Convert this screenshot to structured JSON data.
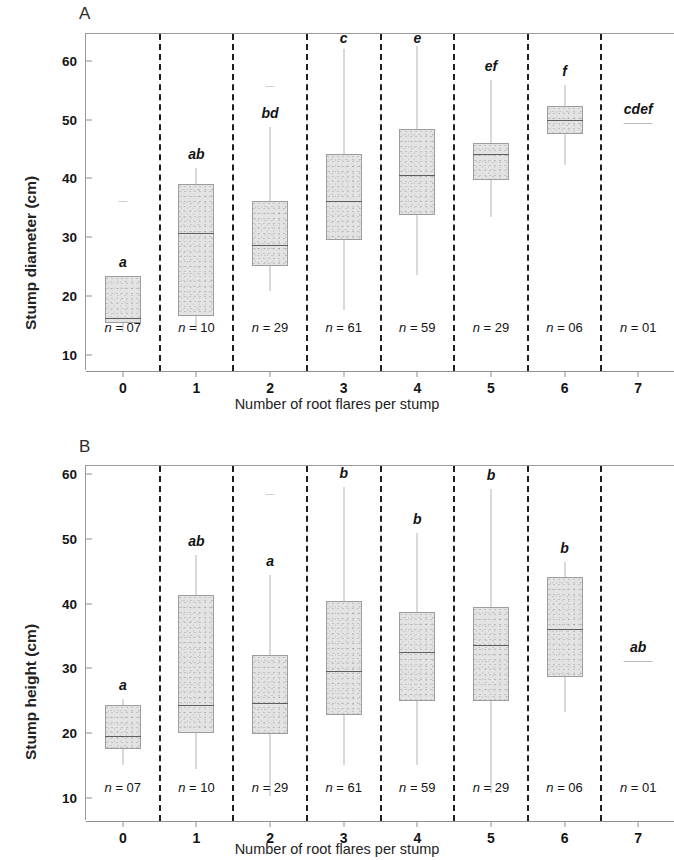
{
  "figure": {
    "panels": [
      {
        "letter": "A",
        "ylabel": "Stump diameter (cm)",
        "xlabel": "Number of root flares per stump"
      },
      {
        "letter": "B",
        "ylabel": "Stump height (cm)",
        "xlabel": "Number of root flares per stump"
      }
    ]
  },
  "chart_data": [
    {
      "type": "box",
      "panel": "A",
      "title": "A",
      "xlabel": "Number of root flares per stump",
      "ylabel": "Stump diameter (cm)",
      "ylim": [
        7,
        64
      ],
      "yticks": [
        10,
        20,
        30,
        40,
        50,
        60
      ],
      "xticks": [
        "0",
        "1",
        "2",
        "3",
        "4",
        "5",
        "6",
        "7"
      ],
      "grid": false,
      "legend": "none",
      "group_separators": "dashed vertical lines between every category",
      "boxes": [
        {
          "category": "0",
          "n_label": "n = 07",
          "n": 7,
          "group_letter": "a",
          "whisker_low": 13.8,
          "q1": 15.3,
          "median": 16.3,
          "q3": 23.4,
          "whisker_high": 23.4,
          "outliers": [
            36.1
          ]
        },
        {
          "category": "1",
          "n_label": "n = 10",
          "n": 10,
          "group_letter": "ab",
          "whisker_low": 14.0,
          "q1": 16.6,
          "median": 30.7,
          "q3": 39.0,
          "whisker_high": 41.8,
          "outliers": []
        },
        {
          "category": "2",
          "n_label": "n = 29",
          "n": 29,
          "group_letter": "bd",
          "whisker_low": 20.8,
          "q1": 25.0,
          "median": 28.6,
          "q3": 36.1,
          "whisker_high": 48.7,
          "outliers": [
            55.8
          ]
        },
        {
          "category": "3",
          "n_label": "n = 61",
          "n": 61,
          "group_letter": "c",
          "whisker_low": 17.6,
          "q1": 29.5,
          "median": 36.1,
          "q3": 44.1,
          "whisker_high": 62.0,
          "outliers": []
        },
        {
          "category": "4",
          "n_label": "n = 59",
          "n": 59,
          "group_letter": "e",
          "whisker_low": 23.6,
          "q1": 33.8,
          "median": 40.5,
          "q3": 48.5,
          "whisker_high": 62.6,
          "outliers": []
        },
        {
          "category": "5",
          "n_label": "n = 29",
          "n": 29,
          "group_letter": "ef",
          "whisker_low": 33.4,
          "q1": 39.8,
          "median": 44.2,
          "q3": 46.1,
          "whisker_high": 56.8,
          "outliers": []
        },
        {
          "category": "6",
          "n_label": "n = 06",
          "n": 6,
          "group_letter": "f",
          "whisker_low": 42.3,
          "q1": 47.6,
          "median": 49.9,
          "q3": 52.3,
          "whisker_high": 55.9,
          "outliers": []
        },
        {
          "category": "7",
          "n_label": "n = 01",
          "n": 1,
          "group_letter": "cdef",
          "single_value": 49.5
        }
      ]
    },
    {
      "type": "box",
      "panel": "B",
      "title": "B",
      "xlabel": "Number of root flares per stump",
      "ylabel": "Stump height (cm)",
      "ylim": [
        7,
        61
      ],
      "yticks": [
        10,
        20,
        30,
        40,
        50,
        60
      ],
      "xticks": [
        "0",
        "1",
        "2",
        "3",
        "4",
        "5",
        "6",
        "7"
      ],
      "grid": false,
      "legend": "none",
      "group_separators": "dashed vertical lines between every category",
      "boxes": [
        {
          "category": "0",
          "n_label": "n = 07",
          "n": 7,
          "group_letter": "a",
          "whisker_low": 15.0,
          "q1": 17.6,
          "median": 19.6,
          "q3": 24.3,
          "whisker_high": 25.2,
          "outliers": []
        },
        {
          "category": "1",
          "n_label": "n = 10",
          "n": 10,
          "group_letter": "ab",
          "whisker_low": 14.5,
          "q1": 20.0,
          "median": 24.4,
          "q3": 41.3,
          "whisker_high": 47.5,
          "outliers": []
        },
        {
          "category": "2",
          "n_label": "n = 29",
          "n": 29,
          "group_letter": "a",
          "whisker_low": 10.2,
          "q1": 19.9,
          "median": 24.7,
          "q3": 32.0,
          "whisker_high": 44.4,
          "outliers": [
            57.0
          ]
        },
        {
          "category": "3",
          "n_label": "n = 61",
          "n": 61,
          "group_letter": "b",
          "whisker_low": 15.0,
          "q1": 22.8,
          "median": 29.6,
          "q3": 40.4,
          "whisker_high": 58.0,
          "outliers": []
        },
        {
          "category": "4",
          "n_label": "n = 59",
          "n": 59,
          "group_letter": "b",
          "whisker_low": 15.0,
          "q1": 24.9,
          "median": 32.6,
          "q3": 38.7,
          "whisker_high": 51.0,
          "outliers": []
        },
        {
          "category": "5",
          "n_label": "n = 29",
          "n": 29,
          "group_letter": "b",
          "whisker_low": 10.8,
          "q1": 25.0,
          "median": 33.6,
          "q3": 39.5,
          "whisker_high": 57.7,
          "outliers": []
        },
        {
          "category": "6",
          "n_label": "n = 06",
          "n": 6,
          "group_letter": "b",
          "whisker_low": 23.2,
          "q1": 28.7,
          "median": 36.1,
          "q3": 44.1,
          "whisker_high": 46.5,
          "outliers": []
        },
        {
          "category": "7",
          "n_label": "n = 01",
          "n": 1,
          "group_letter": "ab",
          "single_value": 31.2
        }
      ]
    }
  ]
}
